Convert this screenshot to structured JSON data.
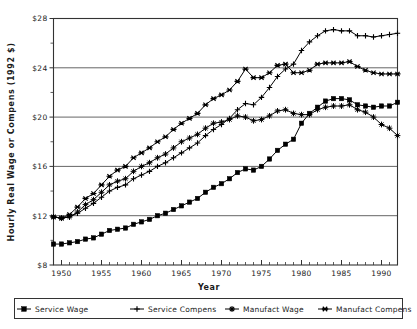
{
  "chart_data": {
    "type": "line",
    "title": "",
    "xlabel": "Year",
    "ylabel": "Hourly Real Wage or Compens (1992 $)",
    "xlim": [
      1949,
      1992
    ],
    "ylim": [
      8,
      28
    ],
    "yticks": [
      "$8",
      "$12",
      "$16",
      "$20",
      "$24",
      "$28"
    ],
    "ytick_values": [
      8,
      12,
      16,
      20,
      24,
      28
    ],
    "xticks": [
      "1950",
      "1955",
      "1960",
      "1965",
      "1970",
      "1975",
      "1980",
      "1985",
      "1990"
    ],
    "xtick_values": [
      1950,
      1955,
      1960,
      1965,
      1970,
      1975,
      1980,
      1985,
      1990
    ],
    "grid": "horizontal-major",
    "legend_position": "below",
    "x": [
      1949,
      1950,
      1951,
      1952,
      1953,
      1954,
      1955,
      1956,
      1957,
      1958,
      1959,
      1960,
      1961,
      1962,
      1963,
      1964,
      1965,
      1966,
      1967,
      1968,
      1969,
      1970,
      1971,
      1972,
      1973,
      1974,
      1975,
      1976,
      1977,
      1978,
      1979,
      1980,
      1981,
      1982,
      1983,
      1984,
      1985,
      1986,
      1987,
      1988,
      1989,
      1990,
      1991,
      1992
    ],
    "series": [
      {
        "name": "Service Wage",
        "marker": "filled-square",
        "values": [
          9.7,
          9.7,
          9.8,
          9.9,
          10.1,
          10.2,
          10.5,
          10.8,
          10.9,
          11.0,
          11.3,
          11.5,
          11.7,
          12.0,
          12.2,
          12.5,
          12.8,
          13.1,
          13.4,
          13.9,
          14.3,
          14.6,
          15.0,
          15.5,
          15.8,
          15.7,
          16.0,
          16.6,
          17.3,
          17.8,
          18.2,
          19.5,
          20.3,
          20.8,
          21.3,
          21.5,
          21.5,
          21.4,
          21.0,
          20.9,
          20.8,
          20.9,
          20.9,
          21.2
        ]
      },
      {
        "name": "Service Compens",
        "marker": "plus",
        "values": [
          11.9,
          11.8,
          11.9,
          12.2,
          12.6,
          13.0,
          13.5,
          14.0,
          14.3,
          14.5,
          15.0,
          15.3,
          15.6,
          16.0,
          16.3,
          16.7,
          17.1,
          17.5,
          17.9,
          18.5,
          19.0,
          19.4,
          19.9,
          20.6,
          21.1,
          21.0,
          21.6,
          22.4,
          23.3,
          23.9,
          24.3,
          25.4,
          26.1,
          26.6,
          27.0,
          27.1,
          27.0,
          27.0,
          26.6,
          26.6,
          26.5,
          26.6,
          26.7,
          26.8
        ]
      },
      {
        "name": "Manufact Wage",
        "marker": "star",
        "values": [
          11.9,
          11.8,
          11.9,
          12.3,
          12.9,
          13.3,
          13.9,
          14.5,
          14.8,
          15.0,
          15.6,
          16.0,
          16.3,
          16.7,
          17.0,
          17.5,
          18.0,
          18.3,
          18.6,
          19.1,
          19.5,
          19.6,
          19.8,
          20.1,
          20.0,
          19.7,
          19.8,
          20.1,
          20.5,
          20.6,
          20.3,
          20.2,
          20.2,
          20.6,
          20.8,
          20.9,
          20.9,
          21.0,
          20.6,
          20.4,
          20.0,
          19.4,
          19.1,
          18.5
        ]
      },
      {
        "name": "Manufact Compens",
        "marker": "x-star",
        "values": [
          11.9,
          11.8,
          12.1,
          12.7,
          13.4,
          13.8,
          14.5,
          15.2,
          15.7,
          16.0,
          16.7,
          17.1,
          17.5,
          18.0,
          18.4,
          19.0,
          19.5,
          19.9,
          20.3,
          21.0,
          21.5,
          21.8,
          22.2,
          22.9,
          23.9,
          23.2,
          23.2,
          23.6,
          24.2,
          24.3,
          23.6,
          23.6,
          23.8,
          24.3,
          24.4,
          24.4,
          24.4,
          24.5,
          24.1,
          23.8,
          23.6,
          23.5,
          23.5,
          23.5
        ]
      }
    ]
  },
  "legend": {
    "items": [
      {
        "label": "Service Wage",
        "marker": "filled-square"
      },
      {
        "label": "Service Compens",
        "marker": "plus"
      },
      {
        "label": "Manufact Wage",
        "marker": "star"
      },
      {
        "label": "Manufact Compens",
        "marker": "x-star"
      }
    ]
  }
}
